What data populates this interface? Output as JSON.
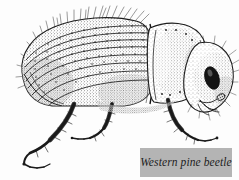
{
  "figure": {
    "subject": "Western pine beetle",
    "illustration_style": "stippled pen-and-ink scientific engraving",
    "orientation": "left lateral profile, facing right",
    "background_color": "#fdfdfd",
    "ink_color": "#1a1a1a"
  },
  "caption": {
    "label": "Western pine beetle",
    "box_color": "#b4b4b4",
    "text_color": "#1d1d1d"
  },
  "anatomy": {
    "parts": [
      {
        "name": "elytra",
        "label": "elytra"
      },
      {
        "name": "pronotum",
        "label": "pronotum"
      },
      {
        "name": "head",
        "label": "head"
      },
      {
        "name": "eye",
        "label": "compound eye"
      },
      {
        "name": "antenna",
        "label": "antenna"
      },
      {
        "name": "foreleg",
        "label": "foreleg"
      },
      {
        "name": "midleg",
        "label": "midleg"
      },
      {
        "name": "hindleg",
        "label": "hindleg"
      },
      {
        "name": "setae",
        "label": "setae"
      }
    ]
  }
}
